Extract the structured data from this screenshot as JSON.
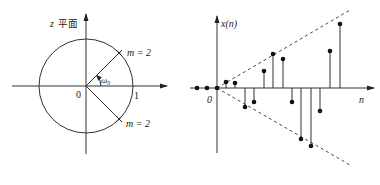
{
  "left_panel": {
    "title": "z 平面",
    "title_var": "z",
    "title_text": "平面",
    "origin_label": "0",
    "unit_label": "1",
    "angle_label": "ω₀",
    "pole_upper_label": "m = 2",
    "pole_lower_label": "m = 2",
    "circle": {
      "cx": 86,
      "cy": 86,
      "r": 47
    },
    "angle_deg": 45
  },
  "right_panel": {
    "y_axis_label": "x(n)",
    "x_axis_label": "n",
    "origin_label": "0",
    "origin": {
      "x": 217,
      "y": 88
    },
    "stems": [
      {
        "x": 197,
        "y": 88
      },
      {
        "x": 207,
        "y": 88
      },
      {
        "x": 217,
        "y": 88
      },
      {
        "x": 226,
        "y": 82
      },
      {
        "x": 235,
        "y": 83
      },
      {
        "x": 245,
        "y": 107
      },
      {
        "x": 254,
        "y": 102
      },
      {
        "x": 264,
        "y": 71
      },
      {
        "x": 273,
        "y": 54
      },
      {
        "x": 283,
        "y": 59
      },
      {
        "x": 292,
        "y": 102
      },
      {
        "x": 301,
        "y": 139
      },
      {
        "x": 311,
        "y": 146
      },
      {
        "x": 320,
        "y": 111
      },
      {
        "x": 330,
        "y": 51
      },
      {
        "x": 340,
        "y": 24
      }
    ],
    "envelope": "growing oscillation (dashed bounds)"
  },
  "colors": {
    "line": "#333333",
    "dash": "#444444",
    "dot": "#111111"
  }
}
